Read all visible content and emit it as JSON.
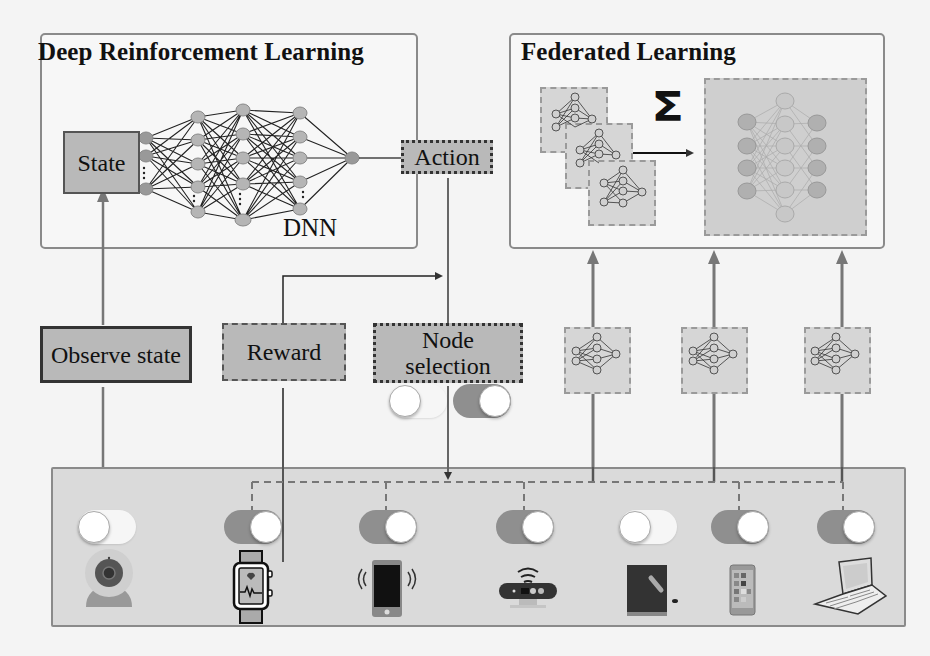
{
  "drl_panel": {
    "title": "Deep Reinforcement Learning",
    "state_label": "State",
    "dnn_label": "DNN",
    "action_label": "Action"
  },
  "fl_panel": {
    "title": "Federated Learning",
    "aggregation_symbol": "Σ"
  },
  "flow": {
    "observe_state_label": "Observe state",
    "reward_label": "Reward",
    "node_selection_label": "Node selection"
  },
  "selection_toggles": [
    {
      "state": "off"
    },
    {
      "state": "on"
    }
  ],
  "devices": [
    {
      "name": "webcam",
      "icon": "webcam-icon",
      "toggle": "off",
      "selected": false
    },
    {
      "name": "smartwatch",
      "icon": "smartwatch-icon",
      "toggle": "on",
      "selected": true
    },
    {
      "name": "smartphone",
      "icon": "smartphone-icon",
      "toggle": "on",
      "selected": true
    },
    {
      "name": "router",
      "icon": "router-icon",
      "toggle": "on",
      "selected": true
    },
    {
      "name": "tablet",
      "icon": "tablet-icon",
      "toggle": "off",
      "selected": false
    },
    {
      "name": "phone",
      "icon": "phone-icon",
      "toggle": "on",
      "selected": true
    },
    {
      "name": "laptop",
      "icon": "laptop-icon",
      "toggle": "on",
      "selected": true
    }
  ],
  "colors": {
    "box_fill": "#b9b9b9",
    "panel_border": "#8a8a8a",
    "toggle_on": "#8f8f8f",
    "toggle_off": "#f6f6f6",
    "node_fill": "#b5b5b5"
  }
}
